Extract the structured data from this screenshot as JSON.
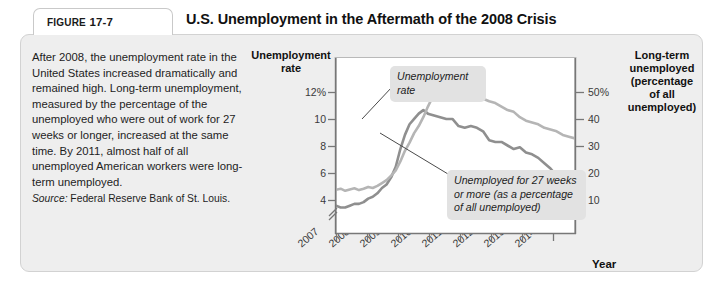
{
  "figure": {
    "label_prefix": "FIGURE",
    "number": "17-7",
    "title": "U.S. Unemployment in the Aftermath of the 2008 Crisis"
  },
  "blurb": {
    "body": "After 2008, the unemployment rate in the United States increased dramatically and remained high. Long-term unemployment, measured by the percentage of the unemployed who were out of work for 27 weeks or longer, increased at the same time. By 2011, almost half of all unemployed American workers were long-term unemployed.",
    "source_label": "Source:",
    "source_text": " Federal Reserve Bank of St. Louis."
  },
  "callouts": {
    "unemployment_rate": "Unemployment rate",
    "long_term": "Unemployed for 27 weeks or more (as a percentage of all unemployed)"
  },
  "colors": {
    "panel_background": "#eeeeee",
    "plot_background": "#ffffff",
    "unemployment_rate_line": "#8f8f8f",
    "long_term_line": "#b5b5b5",
    "callout_background": "#e2e2e2",
    "axis": "#777777",
    "text": "#1d1d1d"
  },
  "chart_data": {
    "type": "line",
    "title": "U.S. Unemployment in the Aftermath of the 2008 Crisis",
    "xlabel": "Year",
    "ylabel": "Unemployment rate",
    "y2label": "Long-term unemployed (percentage of all unemployed)",
    "grid": false,
    "legend": "annotations",
    "axis_break_left": true,
    "xlim": [
      2007.0,
      2014.8
    ],
    "ylim": [
      3.0,
      13.0
    ],
    "y2lim": [
      5.0,
      55.0
    ],
    "yticks": [
      4,
      6,
      8,
      10,
      12
    ],
    "ytick_labels": [
      "4",
      "6",
      "8",
      "10",
      "12%"
    ],
    "y2ticks": [
      10,
      20,
      30,
      40,
      50
    ],
    "y2tick_labels": [
      "10",
      "20",
      "30",
      "40",
      "50%"
    ],
    "xticks": [
      2007,
      2008,
      2009,
      2010,
      2011,
      2012,
      2013,
      2014
    ],
    "xtick_labels": [
      "2007",
      "2008",
      "2009",
      "2010",
      "2011",
      "2012",
      "2013",
      "2014"
    ],
    "series": [
      {
        "name": "Unemployment rate",
        "axis": "left",
        "units": "percent",
        "color": "#8f8f8f",
        "x": [
          2007.0,
          2007.15,
          2007.3,
          2007.45,
          2007.6,
          2007.75,
          2007.9,
          2008.05,
          2008.2,
          2008.35,
          2008.5,
          2008.65,
          2008.8,
          2008.95,
          2009.1,
          2009.25,
          2009.4,
          2009.55,
          2009.7,
          2009.85,
          2010.0,
          2010.2,
          2010.4,
          2010.6,
          2010.8,
          2011.0,
          2011.2,
          2011.4,
          2011.6,
          2011.8,
          2012.0,
          2012.2,
          2012.4,
          2012.6,
          2012.8,
          2013.0,
          2013.2,
          2013.4,
          2013.6,
          2013.8,
          2014.0,
          2014.2,
          2014.4,
          2014.6,
          2014.8
        ],
        "values": [
          4.6,
          4.5,
          4.5,
          4.6,
          4.7,
          4.7,
          4.8,
          5.0,
          5.1,
          5.3,
          5.6,
          5.8,
          6.2,
          6.8,
          7.8,
          8.6,
          9.2,
          9.5,
          9.8,
          10.0,
          9.8,
          9.7,
          9.6,
          9.5,
          9.5,
          9.1,
          9.0,
          9.1,
          9.0,
          8.8,
          8.3,
          8.2,
          8.2,
          8.0,
          7.8,
          7.9,
          7.6,
          7.5,
          7.3,
          7.0,
          6.7,
          6.3,
          6.1,
          5.9,
          5.8
        ]
      },
      {
        "name": "Unemployed for 27 weeks or more (as a percentage of all unemployed)",
        "axis": "right",
        "units": "percent of all unemployed",
        "color": "#b5b5b5",
        "x": [
          2007.0,
          2007.15,
          2007.3,
          2007.45,
          2007.6,
          2007.75,
          2007.9,
          2008.05,
          2008.2,
          2008.35,
          2008.5,
          2008.65,
          2008.8,
          2008.95,
          2009.1,
          2009.25,
          2009.4,
          2009.55,
          2009.7,
          2009.85,
          2010.0,
          2010.2,
          2010.4,
          2010.6,
          2010.8,
          2011.0,
          2011.2,
          2011.4,
          2011.6,
          2011.8,
          2012.0,
          2012.2,
          2012.4,
          2012.6,
          2012.8,
          2013.0,
          2013.2,
          2013.4,
          2013.6,
          2013.8,
          2014.0,
          2014.2,
          2014.4,
          2014.6,
          2014.8
        ],
        "values": [
          17.5,
          17.8,
          17.2,
          17.6,
          17.9,
          17.4,
          17.8,
          18.3,
          18.0,
          18.6,
          19.4,
          20.2,
          21.5,
          23.0,
          25.5,
          28.5,
          30.8,
          33.5,
          35.5,
          38.0,
          41.0,
          44.5,
          45.2,
          44.2,
          44.8,
          44.0,
          44.5,
          43.5,
          43.0,
          43.2,
          42.5,
          42.0,
          41.0,
          40.0,
          39.5,
          38.0,
          37.0,
          36.5,
          36.0,
          35.0,
          34.5,
          34.0,
          33.0,
          32.5,
          32.0
        ]
      }
    ]
  }
}
